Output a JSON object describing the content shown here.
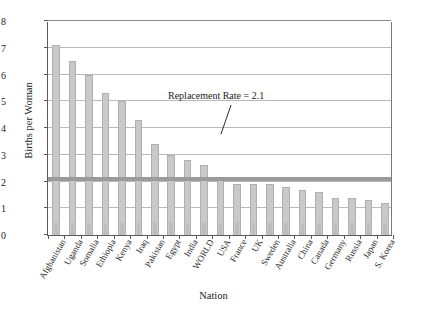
{
  "chart_data": {
    "type": "bar",
    "title": "",
    "xlabel": "Nation",
    "ylabel": "Births per Woman",
    "ylim": [
      0,
      8
    ],
    "yticks": [
      0,
      1,
      2,
      3,
      4,
      5,
      6,
      7,
      8
    ],
    "grid": true,
    "legend": "none",
    "categories": [
      "Afghanistan",
      "Uganda",
      "Somalia",
      "Ethiopia",
      "Kenya",
      "Iraq",
      "Pakistan",
      "Egypt",
      "India",
      "WORLD",
      "USA",
      "France",
      "UK",
      "Sweden",
      "Australia",
      "China",
      "Canada",
      "Germany",
      "Russia",
      "Japan",
      "S. Korea"
    ],
    "values": [
      7.1,
      6.5,
      6.0,
      5.3,
      5.0,
      4.3,
      3.4,
      3.0,
      2.8,
      2.6,
      2.1,
      1.9,
      1.9,
      1.9,
      1.8,
      1.7,
      1.6,
      1.4,
      1.4,
      1.3,
      1.2
    ],
    "annotations": [
      {
        "text": "Replacement Rate = 2.1",
        "value": 2.1
      }
    ],
    "reference_line": {
      "label": "Replacement Rate = 2.1",
      "value": 2.1,
      "color": "#9a9a9a"
    },
    "colors": {
      "bar_fill": "#c9c9c9",
      "bar_edge": "#b0b0b0",
      "grid": "#b9b9b9",
      "axis": "#5a5a5a",
      "text": "#1a1a1a"
    }
  }
}
